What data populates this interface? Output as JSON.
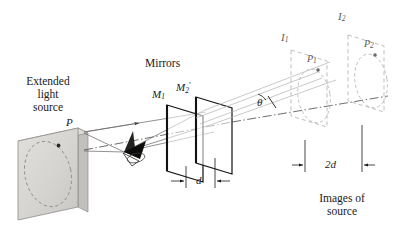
{
  "figure": {
    "type": "optics-ray-diagram",
    "background_color": "#ffffff",
    "ink_color": "#1a1a1a",
    "source_plate_fill": "#d8d6d2",
    "source_plate_edge": "#8e8c88",
    "ghost_line_color": "#b9b7b4",
    "ray_line_color": "#6e6c6a"
  },
  "labels": {
    "extended_source": {
      "line1": "Extended",
      "line2": "light",
      "line3": "source"
    },
    "mirrors_heading": "Mirrors",
    "mirror1": {
      "base": "M",
      "sub": "1"
    },
    "mirror2": {
      "base": "M",
      "sub": "2",
      "prime": "′"
    },
    "source_point": "P",
    "angle": "θ",
    "mirror_gap": "d",
    "image_gap": "2d",
    "image1": {
      "base": "I",
      "sub": "1"
    },
    "image2": {
      "base": "I",
      "sub": "2"
    },
    "image_point1": {
      "base": "P",
      "sub": "1"
    },
    "image_point2": {
      "base": "P",
      "sub": "2"
    },
    "images_caption": {
      "line1": "Images of",
      "line2": "source"
    }
  },
  "geometry": {
    "mirror_separation_label": "d",
    "image_separation_label": "2d",
    "image_separation_relation": "2d = 2 × d",
    "number_of_mirrors": 2,
    "number_of_images": 2
  }
}
